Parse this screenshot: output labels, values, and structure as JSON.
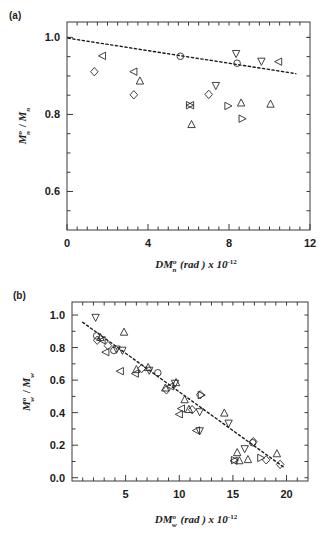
{
  "figure": {
    "background_color": "#ffffff",
    "marker_color": "#2b2b2b",
    "axis_color": "#3a3a3a",
    "fit_line_color": "#1c1c1c"
  },
  "panels": {
    "a": {
      "label": "(a)",
      "y_title_parts": {
        "m": "M",
        "sup": "o",
        "sub": "n",
        "slash": " / ",
        "m2": "M",
        "sub2": "n"
      },
      "x_title_parts": {
        "dm": "DM",
        "sup": "o",
        "sub": "n",
        "unit": " (rad ) x 10",
        "exp": "-12"
      },
      "x_tick_labels": [
        "0",
        "4",
        "8",
        "12"
      ],
      "y_tick_labels": [
        "1.0",
        "0.8",
        "0.6"
      ]
    },
    "b": {
      "label": "(b)",
      "y_title_parts": {
        "m": "M",
        "sup": "o",
        "sub": "w",
        "slash": " / ",
        "m2": "M",
        "sub2": "w"
      },
      "x_title_parts": {
        "dm": "DM",
        "sup": "o",
        "sub": "w",
        "unit": " (rad ) x 10",
        "exp": "-12"
      },
      "x_tick_labels": [
        "5",
        "10",
        "15",
        "20"
      ],
      "y_tick_labels": [
        "1.0",
        "0.8",
        "0.6",
        "0.4",
        "0.2",
        "0.0"
      ]
    }
  },
  "chart_data": [
    {
      "id": "panel-a",
      "type": "scatter",
      "title": "(a)",
      "xlabel": "DM_n^o (rad) x 10^-12",
      "ylabel": "M_n^o / M_n",
      "xlim": [
        0,
        12
      ],
      "ylim": [
        0.5,
        1.04
      ],
      "x_ticks": [
        0,
        4,
        8,
        12
      ],
      "x_minor_ticks": [
        0.5,
        1,
        1.5,
        2,
        2.5,
        3,
        3.5,
        4.5,
        5,
        5.5,
        6,
        6.5,
        7,
        7.5,
        8.5,
        9,
        9.5,
        10,
        10.5,
        11,
        11.5
      ],
      "y_ticks": [
        0.6,
        0.8,
        1.0
      ],
      "y_minor_ticks": [
        0.55,
        0.65,
        0.7,
        0.75,
        0.85,
        0.9,
        0.95,
        1.0
      ],
      "grid": false,
      "legend": "none",
      "series": [
        {
          "name": "left-triangle",
          "marker": "triangle-left",
          "points": [
            {
              "x": 1.75,
              "y": 0.952
            },
            {
              "x": 3.3,
              "y": 0.911
            },
            {
              "x": 6.1,
              "y": 0.824
            },
            {
              "x": 10.45,
              "y": 0.937
            }
          ]
        },
        {
          "name": "diamond",
          "marker": "diamond",
          "points": [
            {
              "x": 1.35,
              "y": 0.911
            },
            {
              "x": 3.3,
              "y": 0.851
            },
            {
              "x": 7.0,
              "y": 0.852
            }
          ]
        },
        {
          "name": "up-triangle",
          "marker": "triangle-up",
          "points": [
            {
              "x": 3.6,
              "y": 0.887
            },
            {
              "x": 6.15,
              "y": 0.774
            },
            {
              "x": 8.6,
              "y": 0.83
            },
            {
              "x": 10.05,
              "y": 0.827
            }
          ]
        },
        {
          "name": "down-triangle",
          "marker": "triangle-down",
          "points": [
            {
              "x": 7.35,
              "y": 0.875
            },
            {
              "x": 8.35,
              "y": 0.958
            },
            {
              "x": 9.6,
              "y": 0.938
            }
          ]
        },
        {
          "name": "right-triangle",
          "marker": "triangle-right",
          "points": [
            {
              "x": 6.05,
              "y": 0.824
            },
            {
              "x": 7.95,
              "y": 0.822
            },
            {
              "x": 8.65,
              "y": 0.789
            }
          ]
        },
        {
          "name": "circle",
          "marker": "circle",
          "points": [
            {
              "x": 5.6,
              "y": 0.951
            },
            {
              "x": 8.4,
              "y": 0.933
            }
          ]
        }
      ],
      "fit_line": {
        "x": [
          0.05,
          11.3
        ],
        "y": [
          0.998,
          0.906
        ],
        "style": "dotted"
      }
    },
    {
      "id": "panel-b",
      "type": "scatter",
      "title": "(b)",
      "xlabel": "DM_w^o (rad) x 10^-12",
      "ylabel": "M_w^o / M_w",
      "xlim": [
        0,
        22
      ],
      "ylim": [
        -0.02,
        1.08
      ],
      "x_ticks": [
        5,
        10,
        15,
        20
      ],
      "x_minor_ticks": [
        1,
        2,
        3,
        4,
        6,
        7,
        8,
        9,
        11,
        12,
        13,
        14,
        16,
        17,
        18,
        19,
        21
      ],
      "y_ticks": [
        0.0,
        0.2,
        0.4,
        0.6,
        0.8,
        1.0
      ],
      "y_minor_ticks": [
        0.1,
        0.3,
        0.5,
        0.7,
        0.9
      ],
      "grid": false,
      "legend": "none",
      "series": [
        {
          "name": "down-triangle",
          "marker": "triangle-down",
          "points": [
            {
              "x": 2.2,
              "y": 0.985
            },
            {
              "x": 4.15,
              "y": 0.79
            },
            {
              "x": 4.7,
              "y": 0.783
            },
            {
              "x": 7.2,
              "y": 0.66
            },
            {
              "x": 9.6,
              "y": 0.58
            },
            {
              "x": 11.9,
              "y": 0.405
            },
            {
              "x": 14.6,
              "y": 0.335
            },
            {
              "x": 11.9,
              "y": 0.288
            },
            {
              "x": 16.1,
              "y": 0.178
            }
          ]
        },
        {
          "name": "left-triangle",
          "marker": "triangle-left",
          "points": [
            {
              "x": 3.15,
              "y": 0.772
            },
            {
              "x": 4.5,
              "y": 0.655
            },
            {
              "x": 5.9,
              "y": 0.64
            },
            {
              "x": 9.2,
              "y": 0.562
            },
            {
              "x": 10.2,
              "y": 0.425
            },
            {
              "x": 10.0,
              "y": 0.39
            },
            {
              "x": 11.6,
              "y": 0.29
            },
            {
              "x": 15.1,
              "y": 0.105
            },
            {
              "x": 2.8,
              "y": 0.845
            }
          ]
        },
        {
          "name": "up-triangle",
          "marker": "triangle-up",
          "points": [
            {
              "x": 4.85,
              "y": 0.895
            },
            {
              "x": 6.0,
              "y": 0.665
            },
            {
              "x": 7.1,
              "y": 0.678
            },
            {
              "x": 8.7,
              "y": 0.552
            },
            {
              "x": 9.7,
              "y": 0.585
            },
            {
              "x": 10.5,
              "y": 0.48
            },
            {
              "x": 10.9,
              "y": 0.42
            },
            {
              "x": 14.2,
              "y": 0.398
            },
            {
              "x": 15.4,
              "y": 0.155
            },
            {
              "x": 15.6,
              "y": 0.105
            },
            {
              "x": 16.4,
              "y": 0.112
            },
            {
              "x": 19.1,
              "y": 0.148
            },
            {
              "x": 2.65,
              "y": 0.862
            }
          ]
        },
        {
          "name": "diamond",
          "marker": "diamond",
          "points": [
            {
              "x": 3.35,
              "y": 0.812
            },
            {
              "x": 6.5,
              "y": 0.672
            },
            {
              "x": 8.8,
              "y": 0.54
            },
            {
              "x": 11.2,
              "y": 0.418
            },
            {
              "x": 11.95,
              "y": 0.51
            },
            {
              "x": 16.9,
              "y": 0.222
            },
            {
              "x": 18.1,
              "y": 0.11
            },
            {
              "x": 19.4,
              "y": 0.082
            },
            {
              "x": 2.35,
              "y": 0.845
            }
          ]
        },
        {
          "name": "circle",
          "marker": "circle",
          "points": [
            {
              "x": 3.9,
              "y": 0.782
            },
            {
              "x": 8.0,
              "y": 0.645
            },
            {
              "x": 16.85,
              "y": 0.215
            },
            {
              "x": 2.3,
              "y": 0.872
            }
          ]
        },
        {
          "name": "right-triangle",
          "marker": "triangle-right",
          "points": [
            {
              "x": 12.05,
              "y": 0.508
            },
            {
              "x": 15.15,
              "y": 0.108
            },
            {
              "x": 17.6,
              "y": 0.122
            }
          ]
        }
      ],
      "fit_line": {
        "x": [
          1.0,
          19.8
        ],
        "y": [
          0.955,
          0.062
        ],
        "style": "dotted"
      }
    }
  ]
}
